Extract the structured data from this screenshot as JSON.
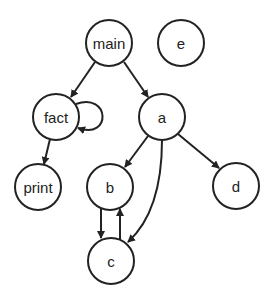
{
  "diagram": {
    "type": "call-graph",
    "nodes": [
      {
        "id": "main",
        "label": "main",
        "x": 109,
        "y": 43
      },
      {
        "id": "e",
        "label": "e",
        "x": 181,
        "y": 43
      },
      {
        "id": "fact",
        "label": "fact",
        "x": 56,
        "y": 117
      },
      {
        "id": "a",
        "label": "a",
        "x": 162,
        "y": 117
      },
      {
        "id": "print",
        "label": "print",
        "x": 38,
        "y": 187
      },
      {
        "id": "b",
        "label": "b",
        "x": 110,
        "y": 187
      },
      {
        "id": "d",
        "label": "d",
        "x": 236,
        "y": 186
      },
      {
        "id": "c",
        "label": "c",
        "x": 111,
        "y": 261
      }
    ],
    "edges": [
      {
        "from": "main",
        "to": "fact"
      },
      {
        "from": "main",
        "to": "a"
      },
      {
        "from": "fact",
        "to": "fact"
      },
      {
        "from": "fact",
        "to": "print"
      },
      {
        "from": "a",
        "to": "b"
      },
      {
        "from": "a",
        "to": "c"
      },
      {
        "from": "a",
        "to": "d"
      },
      {
        "from": "b",
        "to": "c"
      },
      {
        "from": "c",
        "to": "b"
      }
    ],
    "colors": {
      "stroke": "#222222",
      "fill": "#ffffff"
    }
  }
}
